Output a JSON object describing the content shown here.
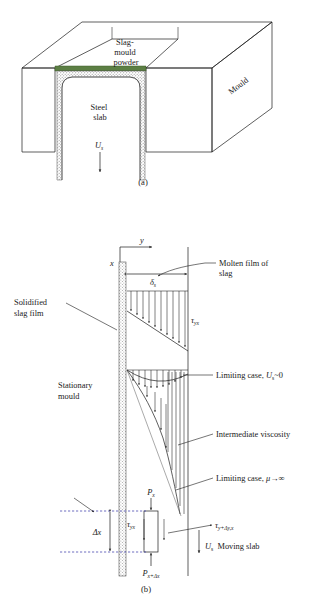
{
  "figure": {
    "panel_a": {
      "tag": "(a)",
      "labels": {
        "slag_mould_powder": "Slag-\nmould\npowder",
        "slag_mould_powder_lines": [
          "Slag-",
          "mould",
          "powder"
        ],
        "mould": "Mould",
        "steel_slab_lines": [
          "Steel",
          "slab"
        ],
        "velocity_symbol": "U",
        "velocity_subscript": "s"
      },
      "colors": {
        "slag_layer": "#4f7a3a",
        "hatch": "#9a9a9a",
        "outline": "#1a1a1a"
      }
    },
    "panel_b": {
      "tag": "(b)",
      "axes": {
        "y_label": "y",
        "x_label": "x"
      },
      "labels": {
        "film_thickness": "δ",
        "film_thickness_sub": "s",
        "shear_top": "τ",
        "shear_top_sub": "yx",
        "molten_film_lines": [
          "Molten film of",
          "slag"
        ],
        "solidified_slag_lines": [
          "Solidified",
          "slag film"
        ],
        "stationary_mould_lines": [
          "Stationary",
          "mould"
        ],
        "limiting_case_us": "Limiting case, ",
        "limiting_case_us_sym": "U",
        "limiting_case_us_sub": "s",
        "limiting_case_us_tail": "~0",
        "intermediate_viscosity": "Intermediate viscosity",
        "limiting_case_mu": "Limiting case, ",
        "limiting_case_mu_sym": "μ→∞",
        "pressure_top": "P",
        "pressure_top_sub": "x",
        "pressure_bottom": "P",
        "pressure_bottom_sub": "x+Δx",
        "tau_yx": "τ",
        "tau_yx_sub": "yx",
        "tau_ydy": "τ",
        "tau_ydy_sub": "y+Δy,x",
        "delta_x": "Δx",
        "moving_slab_sym": "U",
        "moving_slab_sub": "s",
        "moving_slab_text": "Moving slab"
      },
      "colors": {
        "dashed_guide": "#4a4ab0",
        "hatch": "#9a9a9a",
        "outline": "#1a1a1a"
      }
    },
    "caption": ""
  }
}
